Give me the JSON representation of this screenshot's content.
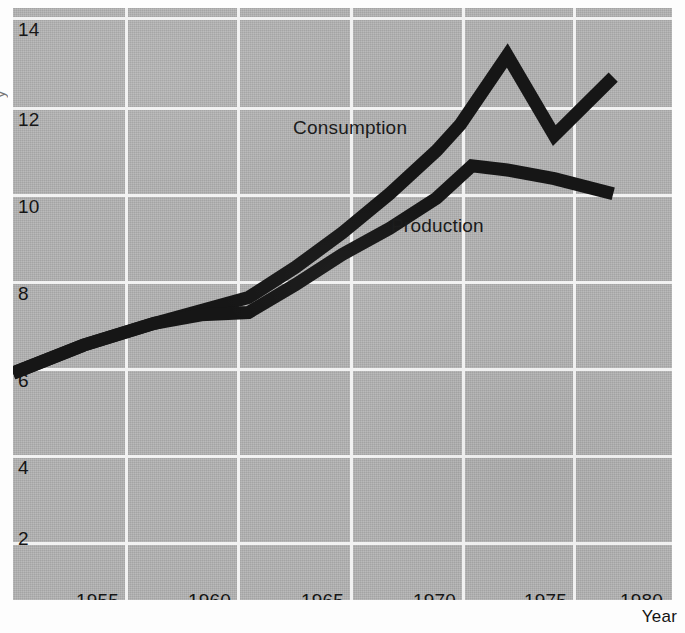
{
  "figure": {
    "background_color": "#b2b2b2",
    "gridline_color": "#f2f2f2",
    "series_color": "#161616",
    "edge_caption_fragment": "y"
  },
  "axes": {
    "x_axis_title": "Year",
    "y_ticks": [
      "14",
      "12",
      "10",
      "8",
      "6",
      "4",
      "2"
    ],
    "x_ticks": [
      "1955",
      "1960",
      "1965",
      "1970",
      "1975",
      "1980"
    ]
  },
  "series_labels": {
    "consumption": "Consumption",
    "production": "Production"
  },
  "chart_data": {
    "type": "line",
    "title": "",
    "xlabel": "Year",
    "ylabel": "",
    "xlim": [
      1952,
      1980
    ],
    "ylim": [
      1.0,
      14.7
    ],
    "grid": true,
    "legend": "inline-annotations",
    "xticks": [
      1955,
      1960,
      1965,
      1970,
      1975,
      1980
    ],
    "yticks": [
      2,
      4,
      6,
      8,
      10,
      12,
      14
    ],
    "series": [
      {
        "name": "Consumption",
        "x": [
          1952,
          1955,
          1958,
          1960,
          1962,
          1964,
          1966,
          1968,
          1970,
          1971,
          1973,
          1975,
          1977.5
        ],
        "values": [
          6.25,
          6.9,
          7.4,
          7.7,
          8.0,
          8.7,
          9.5,
          10.4,
          11.4,
          12.0,
          13.6,
          11.75,
          13.1
        ]
      },
      {
        "name": "Production",
        "x": [
          1952,
          1955,
          1958,
          1960,
          1962,
          1964,
          1966,
          1968,
          1970,
          1971.5,
          1973,
          1975,
          1977.5
        ],
        "values": [
          6.25,
          6.9,
          7.4,
          7.6,
          7.65,
          8.3,
          9.0,
          9.6,
          10.3,
          11.05,
          10.95,
          10.75,
          10.4
        ]
      }
    ]
  }
}
